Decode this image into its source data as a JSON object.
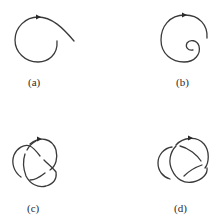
{
  "figure": {
    "panels": [
      {
        "id": "a",
        "label": "(a)",
        "description": "open curve forming a loop with a tail, arrow indicating direction"
      },
      {
        "id": "b",
        "label": "(b)",
        "description": "spiral curve curling inward, arrow indicating direction"
      },
      {
        "id": "c",
        "label": "(c)",
        "description": "trefoil-like knot diagram with arrow"
      },
      {
        "id": "d",
        "label": "(d)",
        "description": "knot diagram variant with arrow"
      }
    ],
    "colors": {
      "stroke": "#3a3a3a",
      "background": "#ffffff"
    }
  }
}
